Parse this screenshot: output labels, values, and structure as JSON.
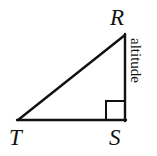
{
  "figure": {
    "kind": "right-triangle-diagram",
    "background_color": "#ffffff",
    "stroke_color": "#111111",
    "stroke_width": 2,
    "canvas": {
      "width": 157,
      "height": 156
    },
    "vertices": [
      {
        "id": "R",
        "label": "R",
        "x": 125,
        "y": 35
      },
      {
        "id": "T",
        "label": "T",
        "x": 18,
        "y": 120
      },
      {
        "id": "S",
        "label": "S",
        "x": 125,
        "y": 120
      }
    ],
    "edges": [
      {
        "id": "TR",
        "from": "T",
        "to": "R",
        "role": "hypotenuse"
      },
      {
        "id": "TS",
        "from": "T",
        "to": "S",
        "role": "base"
      },
      {
        "id": "RS",
        "from": "R",
        "to": "S",
        "role": "altitude"
      }
    ],
    "right_angle": {
      "at_vertex": "S",
      "marker": "square",
      "size": 19
    },
    "side_labels": [
      {
        "id": "altitude",
        "text": "altitude",
        "for_edge": "RS",
        "rotation_deg": 90
      }
    ]
  }
}
